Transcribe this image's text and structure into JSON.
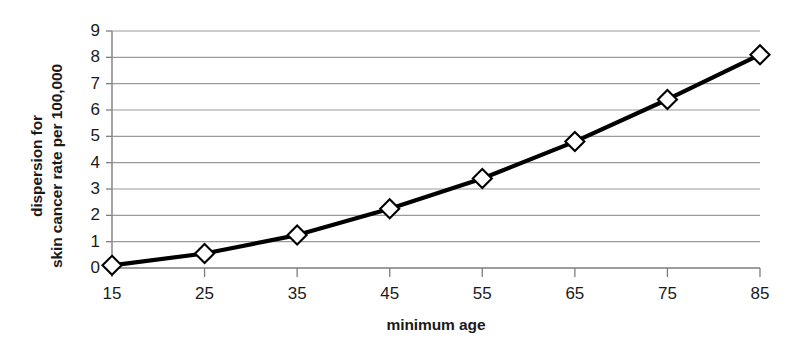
{
  "chart_data": {
    "type": "line",
    "title": "",
    "xlabel": "minimum age",
    "ylabel": "dispersion for skin cancer rate per 100,000",
    "ylabel_lines": [
      "dispersion for",
      "skin cancer rate per 100,000"
    ],
    "x": [
      15,
      25,
      35,
      45,
      55,
      65,
      75,
      85
    ],
    "values": [
      0.1,
      0.55,
      1.25,
      2.25,
      3.4,
      4.8,
      6.4,
      8.1
    ],
    "series": [
      {
        "name": "dispersion",
        "values": [
          0.1,
          0.55,
          1.25,
          2.25,
          3.4,
          4.8,
          6.4,
          8.1
        ]
      }
    ],
    "xlim": [
      15,
      85
    ],
    "ylim": [
      0,
      9
    ],
    "xticks": [
      "15",
      "25",
      "35",
      "45",
      "55",
      "65",
      "75",
      "85"
    ],
    "yticks": [
      "0",
      "1",
      "2",
      "3",
      "4",
      "5",
      "6",
      "7",
      "8",
      "9"
    ],
    "grid": "horizontal",
    "legend": "none",
    "marker": "diamond-open",
    "line_color": "#000000",
    "grid_color": "#9a9a9a",
    "background_color": "#ffffff"
  }
}
